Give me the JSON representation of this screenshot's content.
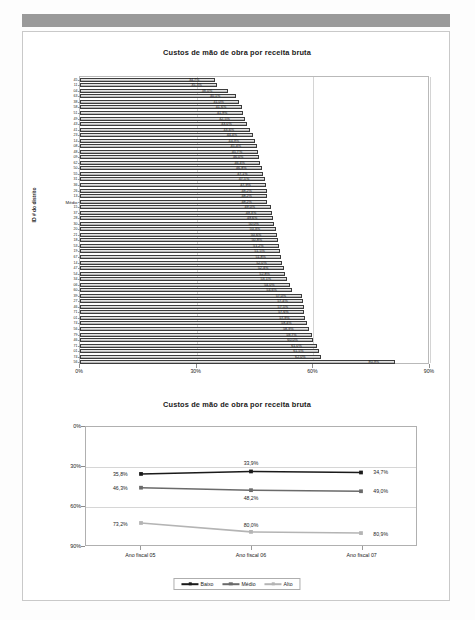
{
  "document": {
    "page_background": "#fdfdfd",
    "header_band_color": "#9a9a9a"
  },
  "bar_chart": {
    "title": "Custos de mão de obra por receita bruta",
    "y_axis_title": "ID # do distrito",
    "x_ticks": [
      "0%",
      "30%",
      "60%",
      "90%"
    ]
  },
  "line_chart": {
    "title": "Custos de mão de obra por receita bruta",
    "y_ticks": [
      "0%",
      "30%",
      "60%",
      "90%"
    ],
    "x_ticks": [
      "Ano fiscal 05",
      "Ano fiscal 06",
      "Ano fiscal 07"
    ],
    "legend": [
      "Baixo",
      "Médio",
      "Alto"
    ]
  },
  "chart_data": [
    {
      "type": "bar",
      "orientation": "horizontal",
      "title": "Custos de mão de obra por receita bruta",
      "xlabel": "",
      "ylabel": "ID # do distrito",
      "xlim": [
        0,
        90
      ],
      "x_tick_values": [
        0,
        30,
        60,
        90
      ],
      "x_tick_labels": [
        "0%",
        "30%",
        "60%",
        "90%"
      ],
      "grid": true,
      "legend": "none",
      "value_suffix": "%",
      "decimal_separator": ",",
      "categories": [
        "45",
        "11",
        "04",
        "63",
        "38",
        "58",
        "51",
        "49",
        "43",
        "41",
        "23",
        "14",
        "08",
        "48",
        "09",
        "62",
        "50",
        "55",
        "31",
        "36",
        "26",
        "13",
        "Médio",
        "15",
        "37",
        "28",
        "30",
        "20",
        "21",
        "18",
        "53",
        "19",
        "67",
        "14b",
        "47",
        "54",
        "34",
        "06",
        "60",
        "39",
        "27",
        "46",
        "71",
        "01",
        "74",
        "56",
        "79"
      ],
      "values": [
        34.7,
        35.3,
        38.0,
        40.1,
        41.0,
        41.6,
        41.9,
        42.5,
        43.0,
        43.6,
        44.4,
        44.9,
        45.4,
        45.7,
        46.0,
        46.4,
        46.8,
        47.1,
        47.5,
        47.9,
        48.2,
        48.2,
        48.2,
        49.0,
        49.3,
        49.6,
        50.0,
        50.3,
        50.6,
        50.8,
        51.2,
        51.5,
        51.8,
        52.0,
        52.4,
        52.8,
        53.1,
        54.0,
        54.6,
        57.0,
        57.4,
        57.5,
        57.6,
        57.9,
        58.4,
        58.9,
        59.7
      ],
      "extra_rows": [
        {
          "category": "46b",
          "value": 60.0
        },
        {
          "category": "71b",
          "value": 61.0
        },
        {
          "category": "01b",
          "value": 61.5
        },
        {
          "category": "74b",
          "value": 62.0
        },
        {
          "category": "56",
          "value": 80.9
        }
      ],
      "outlier": {
        "category": "56",
        "value": 80.9,
        "label": "80,9%"
      },
      "mean_row": {
        "category": "Médio",
        "value": 48.2,
        "label": "48,2%"
      }
    },
    {
      "type": "line",
      "title": "Custos de mão de obra por receita bruta",
      "x": [
        "Ano fiscal 05",
        "Ano fiscal 06",
        "Ano fiscal 07"
      ],
      "ylim": [
        0,
        90
      ],
      "y_inverted": true,
      "y_tick_values": [
        0,
        30,
        60,
        90
      ],
      "y_tick_labels": [
        "0%",
        "30%",
        "60%",
        "90%"
      ],
      "grid": true,
      "legend_position": "bottom",
      "series": [
        {
          "name": "Baixo",
          "color": "#1a1a1a",
          "values": [
            35.8,
            33.9,
            34.7
          ],
          "labels": [
            "35,8%",
            "33,9%",
            "34,7%"
          ],
          "label_positions": [
            "left",
            "above",
            "right"
          ]
        },
        {
          "name": "Médio",
          "color": "#6a6a6a",
          "values": [
            46.3,
            48.2,
            49.0
          ],
          "labels": [
            "46,3%",
            "48,2%",
            "49,0%"
          ],
          "label_positions": [
            "left",
            "below",
            "right"
          ]
        },
        {
          "name": "Alto",
          "color": "#b4b4b4",
          "values": [
            73.2,
            80.0,
            80.9
          ],
          "labels": [
            "73,2%",
            "80,0%",
            "80,9%"
          ],
          "label_positions": [
            "left",
            "above",
            "right"
          ]
        }
      ]
    }
  ]
}
